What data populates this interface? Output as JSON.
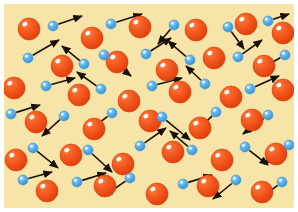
{
  "figure": {
    "width": 298,
    "height": 212
  },
  "colors": {
    "outer_background": "#ffffff",
    "field_background": "#f7e4a8",
    "field_background_edge": "#f3dd95",
    "large_particle_fill": "#f04a18",
    "large_particle_fill_light": "#fb7a38",
    "large_particle_edge": "#d93b0c",
    "large_particle_highlight": "#ffffff",
    "small_particle_fill": "#4da9e8",
    "small_particle_fill_light": "#8fd0f4",
    "small_particle_edge": "#2f8fd4",
    "small_particle_highlight": "#ffffff",
    "arrow_color": "#1a1008"
  },
  "field": {
    "x": 4,
    "y": 4,
    "width": 290,
    "height": 204,
    "corner_radius": 2
  },
  "legend": {
    "large_particle_label": "large particle",
    "small_particle_label": "small particle",
    "arrow_label": "velocity vector"
  },
  "geometry": {
    "large_particle_radius": 11,
    "small_particle_radius": 5,
    "arrow_head_length": 7,
    "arrow_head_width": 5,
    "arrow_stroke_width": 1.6
  },
  "large_particles": [
    {
      "cx": 29,
      "cy": 29
    },
    {
      "cx": 92,
      "cy": 38
    },
    {
      "cx": 140,
      "cy": 27
    },
    {
      "cx": 196,
      "cy": 30
    },
    {
      "cx": 246,
      "cy": 24
    },
    {
      "cx": 283,
      "cy": 33
    },
    {
      "cx": 62,
      "cy": 66
    },
    {
      "cx": 117,
      "cy": 62
    },
    {
      "cx": 167,
      "cy": 70
    },
    {
      "cx": 214,
      "cy": 58
    },
    {
      "cx": 264,
      "cy": 66
    },
    {
      "cx": 14,
      "cy": 88
    },
    {
      "cx": 79,
      "cy": 95
    },
    {
      "cx": 129,
      "cy": 101
    },
    {
      "cx": 180,
      "cy": 92
    },
    {
      "cx": 231,
      "cy": 97
    },
    {
      "cx": 283,
      "cy": 90
    },
    {
      "cx": 36,
      "cy": 122
    },
    {
      "cx": 94,
      "cy": 129
    },
    {
      "cx": 150,
      "cy": 121
    },
    {
      "cx": 200,
      "cy": 128
    },
    {
      "cx": 252,
      "cy": 120
    },
    {
      "cx": 16,
      "cy": 160
    },
    {
      "cx": 71,
      "cy": 155
    },
    {
      "cx": 123,
      "cy": 164
    },
    {
      "cx": 173,
      "cy": 152
    },
    {
      "cx": 222,
      "cy": 160
    },
    {
      "cx": 276,
      "cy": 154
    },
    {
      "cx": 47,
      "cy": 191
    },
    {
      "cx": 105,
      "cy": 186
    },
    {
      "cx": 157,
      "cy": 194
    },
    {
      "cx": 208,
      "cy": 186
    },
    {
      "cx": 262,
      "cy": 192
    }
  ],
  "small_particles": [
    {
      "cx": 53,
      "cy": 26,
      "ax": 82,
      "ay": 16
    },
    {
      "cx": 111,
      "cy": 24,
      "ax": 142,
      "ay": 14
    },
    {
      "cx": 174,
      "cy": 25,
      "ax": 158,
      "ay": 44
    },
    {
      "cx": 228,
      "cy": 27,
      "ax": 244,
      "ay": 49
    },
    {
      "cx": 268,
      "cy": 21,
      "ax": 289,
      "ay": 14
    },
    {
      "cx": 28,
      "cy": 58,
      "ax": 59,
      "ay": 40
    },
    {
      "cx": 84,
      "cy": 64,
      "ax": 62,
      "ay": 46
    },
    {
      "cx": 104,
      "cy": 55,
      "ax": 131,
      "ay": 76
    },
    {
      "cx": 146,
      "cy": 54,
      "ax": 171,
      "ay": 38
    },
    {
      "cx": 190,
      "cy": 60,
      "ax": 168,
      "ay": 41
    },
    {
      "cx": 238,
      "cy": 57,
      "ax": 262,
      "ay": 40
    },
    {
      "cx": 285,
      "cy": 55,
      "ax": 259,
      "ay": 70
    },
    {
      "cx": 46,
      "cy": 86,
      "ax": 75,
      "ay": 78
    },
    {
      "cx": 101,
      "cy": 89,
      "ax": 77,
      "ay": 72
    },
    {
      "cx": 152,
      "cy": 86,
      "ax": 182,
      "ay": 78
    },
    {
      "cx": 205,
      "cy": 84,
      "ax": 186,
      "ay": 66
    },
    {
      "cx": 250,
      "cy": 89,
      "ax": 279,
      "ay": 76
    },
    {
      "cx": 11,
      "cy": 114,
      "ax": 40,
      "ay": 105
    },
    {
      "cx": 64,
      "cy": 116,
      "ax": 42,
      "ay": 136
    },
    {
      "cx": 112,
      "cy": 113,
      "ax": 86,
      "ay": 133
    },
    {
      "cx": 162,
      "cy": 117,
      "ax": 190,
      "ay": 140
    },
    {
      "cx": 216,
      "cy": 112,
      "ax": 195,
      "ay": 133
    },
    {
      "cx": 268,
      "cy": 115,
      "ax": 243,
      "ay": 134
    },
    {
      "cx": 33,
      "cy": 148,
      "ax": 58,
      "ay": 168
    },
    {
      "cx": 88,
      "cy": 150,
      "ax": 112,
      "ay": 172
    },
    {
      "cx": 140,
      "cy": 146,
      "ax": 166,
      "ay": 128
    },
    {
      "cx": 192,
      "cy": 150,
      "ax": 170,
      "ay": 131
    },
    {
      "cx": 245,
      "cy": 147,
      "ax": 268,
      "ay": 165
    },
    {
      "cx": 289,
      "cy": 145,
      "ax": 264,
      "ay": 164
    },
    {
      "cx": 23,
      "cy": 180,
      "ax": 52,
      "ay": 172
    },
    {
      "cx": 77,
      "cy": 182,
      "ax": 106,
      "ay": 173
    },
    {
      "cx": 130,
      "cy": 178,
      "ax": 104,
      "ay": 196
    },
    {
      "cx": 183,
      "cy": 184,
      "ax": 212,
      "ay": 175
    },
    {
      "cx": 236,
      "cy": 180,
      "ax": 213,
      "ay": 199
    },
    {
      "cx": 282,
      "cy": 182,
      "ax": 258,
      "ay": 200
    }
  ]
}
